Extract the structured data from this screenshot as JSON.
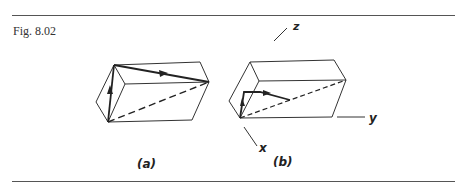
{
  "figure": {
    "caption": "Fig. 8.02",
    "panels": [
      {
        "label": "(a)"
      },
      {
        "label": "(b)"
      }
    ],
    "axes": {
      "x": "x",
      "y": "y",
      "z": "z"
    },
    "colors": {
      "ink": "#222222",
      "rule": "#555555"
    }
  }
}
